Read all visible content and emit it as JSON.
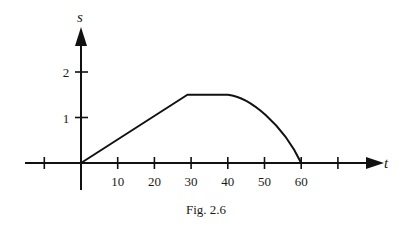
{
  "figure": {
    "caption": "Fig. 2.6"
  },
  "chart_data": {
    "type": "line",
    "title": "",
    "xlabel": "t",
    "ylabel": "s",
    "x_ticks": [
      -10,
      10,
      20,
      30,
      40,
      50,
      60,
      70
    ],
    "x_tick_labels": [
      "",
      "10",
      "20",
      "30",
      "40",
      "50",
      "60",
      ""
    ],
    "y_ticks": [
      1,
      2
    ],
    "y_tick_labels": [
      "1",
      "2"
    ],
    "xlim": [
      -20,
      80
    ],
    "ylim": [
      -0.5,
      3
    ],
    "grid": false,
    "legend": null,
    "series": [
      {
        "name": "s(t)",
        "segments": [
          {
            "kind": "linear",
            "points": [
              [
                0,
                0
              ],
              [
                29,
                1.5
              ]
            ]
          },
          {
            "kind": "constant",
            "points": [
              [
                29,
                1.5
              ],
              [
                40,
                1.5
              ]
            ]
          },
          {
            "kind": "curve (concave down)",
            "points": [
              [
                40,
                1.5
              ],
              [
                45,
                1.35
              ],
              [
                50,
                1.05
              ],
              [
                55,
                0.6
              ],
              [
                60,
                0
              ]
            ]
          }
        ],
        "x": [
          0,
          29,
          40,
          45,
          50,
          55,
          60
        ],
        "y": [
          0,
          1.5,
          1.5,
          1.35,
          1.05,
          0.6,
          0
        ]
      }
    ]
  }
}
